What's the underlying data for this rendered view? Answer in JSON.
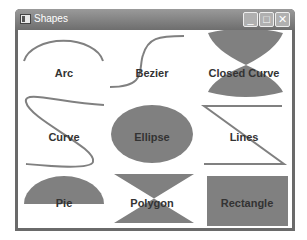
{
  "window": {
    "title": "Shapes",
    "icon": "app-icon",
    "controls": {
      "minimize": "_",
      "maximize": "□",
      "close": "✕"
    }
  },
  "shape_color": "#808080",
  "shapes": [
    {
      "name": "Arc",
      "label": "Arc"
    },
    {
      "name": "Bezier",
      "label": "Bezier"
    },
    {
      "name": "Closed Curve",
      "label": "Closed Curve"
    },
    {
      "name": "Curve",
      "label": "Curve"
    },
    {
      "name": "Ellipse",
      "label": "Ellipse"
    },
    {
      "name": "Lines",
      "label": "Lines"
    },
    {
      "name": "Pie",
      "label": "Pie"
    },
    {
      "name": "Polygon",
      "label": "Polygon"
    },
    {
      "name": "Rectangle",
      "label": "Rectangle"
    }
  ]
}
